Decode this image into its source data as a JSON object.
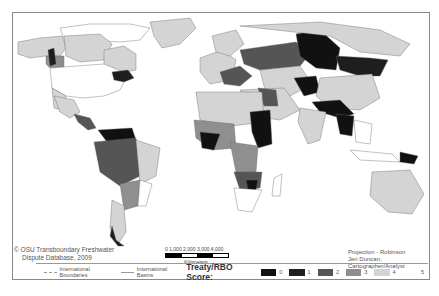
{
  "map": {
    "title": "Treaty/RBO Score world map of international river basins",
    "projection": "Projection - Robinson",
    "author": "Jen Duncan, Cartographer/Analyst",
    "credit_line1": "© OSU Transboundary Freshwater",
    "credit_line2": "Dispute Database, 2009",
    "scale": {
      "ticks": "0  1,000 2,000 3,000 4,000",
      "unit": "Kilometers"
    }
  },
  "legend": {
    "boundaries_label": "International Boundaries",
    "basins_label": "International Basins",
    "score_title": "Treaty/RBO Score:",
    "classes": [
      {
        "label": "0",
        "color": "#111111"
      },
      {
        "label": "1",
        "color": "#1e1e1e"
      },
      {
        "label": "2",
        "color": "#555555"
      },
      {
        "label": "3",
        "color": "#8f8f8f"
      },
      {
        "label": "4",
        "color": "#d4d4d4"
      },
      {
        "label": "5",
        "color": "#ffffff"
      }
    ]
  }
}
